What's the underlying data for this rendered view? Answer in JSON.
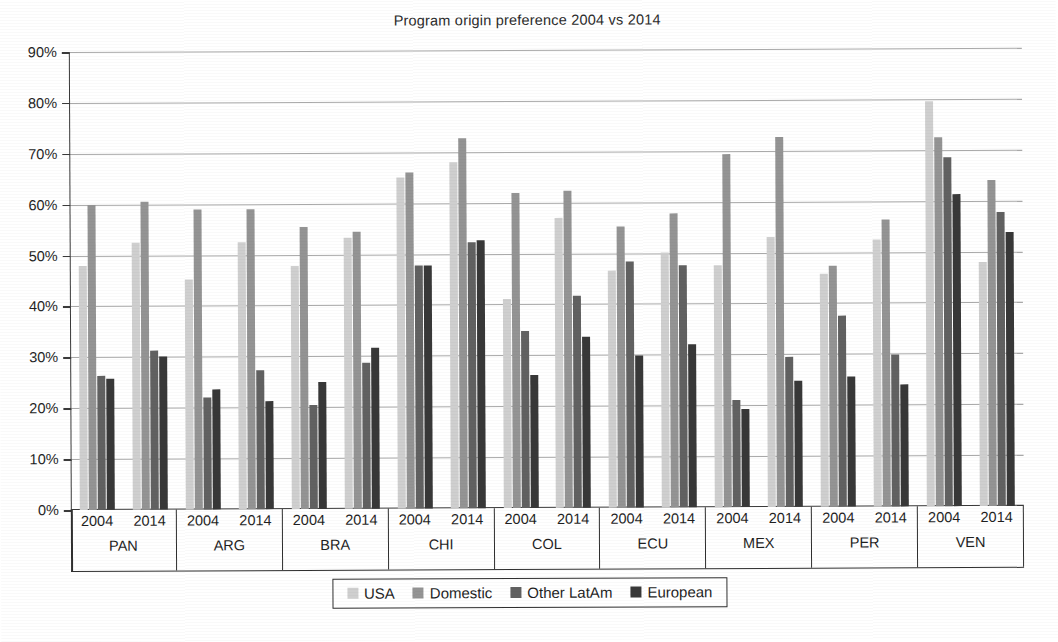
{
  "chart_data": {
    "type": "bar",
    "title": "Program origin preference 2004 vs 2014",
    "xlabel": "",
    "ylabel": "",
    "ylim": [
      0,
      90
    ],
    "ytick_labels": [
      "0%",
      "10%",
      "20%",
      "30%",
      "40%",
      "50%",
      "60%",
      "70%",
      "80%",
      "90%"
    ],
    "ytick_values": [
      0,
      10,
      20,
      30,
      40,
      50,
      60,
      70,
      80,
      90
    ],
    "grid": true,
    "legend_position": "bottom",
    "countries": [
      "PAN",
      "ARG",
      "BRA",
      "CHI",
      "COL",
      "ECU",
      "MEX",
      "PER",
      "VEN"
    ],
    "years": [
      "2004",
      "2014"
    ],
    "categories": [
      "PAN 2004",
      "PAN 2014",
      "ARG 2004",
      "ARG 2014",
      "BRA 2004",
      "BRA 2014",
      "CHI 2004",
      "CHI 2014",
      "COL 2004",
      "COL 2014",
      "ECU 2004",
      "ECU 2014",
      "MEX 2004",
      "MEX 2014",
      "PER 2004",
      "PER 2014",
      "VEN 2004",
      "VEN 2014"
    ],
    "series": [
      {
        "name": "USA",
        "color": "#cfcfcf",
        "values": [
          48.0,
          52.5,
          45.2,
          52.4,
          47.7,
          53.2,
          65.0,
          68.0,
          41.0,
          57.0,
          46.5,
          50.2,
          47.5,
          53.0,
          45.8,
          52.5,
          79.6,
          48.0
        ]
      },
      {
        "name": "Domestic",
        "color": "#949494",
        "values": [
          60.0,
          60.6,
          59.0,
          59.0,
          55.4,
          54.5,
          66.0,
          72.8,
          62.0,
          62.2,
          55.2,
          57.7,
          69.3,
          72.7,
          47.3,
          56.4,
          72.6,
          64.0
        ]
      },
      {
        "name": "Other LatAm",
        "color": "#616161",
        "values": [
          26.3,
          31.2,
          22.0,
          27.4,
          20.5,
          28.7,
          47.7,
          52.3,
          34.7,
          41.6,
          48.4,
          47.5,
          21.0,
          29.4,
          37.6,
          29.8,
          68.6,
          57.7
        ]
      },
      {
        "name": "European",
        "color": "#383838",
        "values": [
          25.8,
          30.0,
          23.6,
          21.2,
          25.0,
          31.7,
          47.7,
          52.6,
          26.2,
          33.7,
          29.8,
          32.0,
          19.3,
          24.7,
          25.5,
          24.0,
          61.4,
          53.8
        ]
      }
    ]
  }
}
